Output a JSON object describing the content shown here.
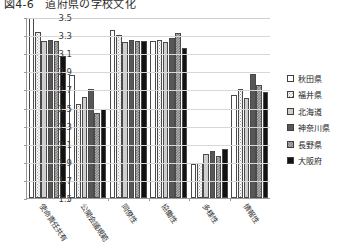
{
  "chart_data": {
    "type": "bar",
    "title": "図4-6　道府県の学校文化",
    "xlabel": "",
    "ylabel": "",
    "ylim": [
      1.5,
      3.5
    ],
    "ytick_step": 0.2,
    "yticks": [
      "3.5",
      "3.3",
      "3.1",
      "2.9",
      "2.7",
      "2.5",
      "2.3",
      "2.1",
      "1.9",
      "1.7",
      "1.5"
    ],
    "grid": true,
    "legend_position": "right",
    "categories": [
      "使命責任共有",
      "公開会議規範",
      "同僚性",
      "協働性",
      "多様性",
      "情報性"
    ],
    "series": [
      {
        "name": "秋田県",
        "color": "#ffffff",
        "pattern": "solid-white",
        "values": [
          3.5,
          2.87,
          3.37,
          3.24,
          1.88,
          2.65
        ]
      },
      {
        "name": "福井県",
        "color": "#fbfbfb",
        "pattern": "dotted",
        "values": [
          3.35,
          2.55,
          3.31,
          3.26,
          1.89,
          2.71
        ]
      },
      {
        "name": "北海道",
        "color": "#cfcfcf",
        "pattern": "solid-light",
        "values": [
          3.25,
          2.62,
          3.23,
          3.23,
          1.99,
          2.61
        ]
      },
      {
        "name": "神奈川県",
        "color": "#575757",
        "pattern": "solid-dark",
        "values": [
          3.26,
          2.71,
          3.26,
          3.28,
          2.02,
          2.88
        ]
      },
      {
        "name": "長野県",
        "color": "#b5b5b5",
        "pattern": "checker",
        "values": [
          3.25,
          2.44,
          3.25,
          3.33,
          1.97,
          2.76
        ]
      },
      {
        "name": "大阪府",
        "color": "#121212",
        "pattern": "solid-black",
        "values": [
          3.08,
          2.49,
          3.24,
          3.17,
          2.04,
          2.68
        ]
      }
    ]
  }
}
